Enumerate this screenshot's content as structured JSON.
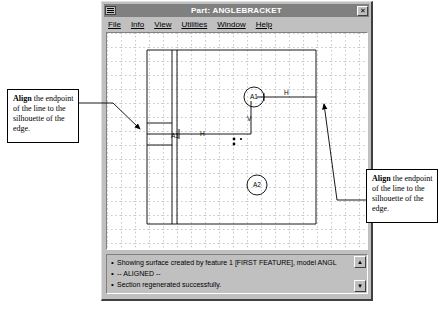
{
  "window": {
    "title": "Part: ANGLEBRACKET",
    "close_label": "✕",
    "system_menu_icon": "system-menu-icon"
  },
  "menu": {
    "items": [
      {
        "label": "File"
      },
      {
        "label": "Info"
      },
      {
        "label": "View"
      },
      {
        "label": "Utilities"
      },
      {
        "label": "Window"
      },
      {
        "label": "Help"
      }
    ]
  },
  "graphics": {
    "grid": {
      "spacing": 14,
      "style": "dotted",
      "color": "#8a8a8a"
    },
    "labels": [
      {
        "name": "constraint-a1-circle",
        "text": "A1"
      },
      {
        "name": "constraint-a2-circle",
        "text": "A2"
      },
      {
        "name": "constraint-a1-inline",
        "text": "A1"
      },
      {
        "name": "constraint-h-upper",
        "text": "H"
      },
      {
        "name": "constraint-h-lower",
        "text": "H"
      },
      {
        "name": "constraint-v",
        "text": "V"
      }
    ]
  },
  "messages": {
    "lines": [
      {
        "bullet": "•",
        "text": "Showing surface created by feature 1 [FIRST FEATURE], model  ANGL"
      },
      {
        "bullet": "•",
        "text": "-- ALIGNED --"
      },
      {
        "bullet": "•",
        "text": "Section regenerated successfully."
      }
    ],
    "scroll_up": "▲",
    "scroll_down": "▼"
  },
  "callouts": {
    "left": {
      "bold": "Align",
      "text": " the endpoint of the line to the silhouette of the edge."
    },
    "right": {
      "bold": "Align",
      "text": " the endpoint of the line to the silhouette of the edge."
    }
  },
  "colors": {
    "window_face": "#c0c0c0",
    "title_bar": "#808080",
    "title_text": "#ffffff",
    "canvas": "#ffffff",
    "geometry": "#000000",
    "grid": "#8a8a8a"
  }
}
